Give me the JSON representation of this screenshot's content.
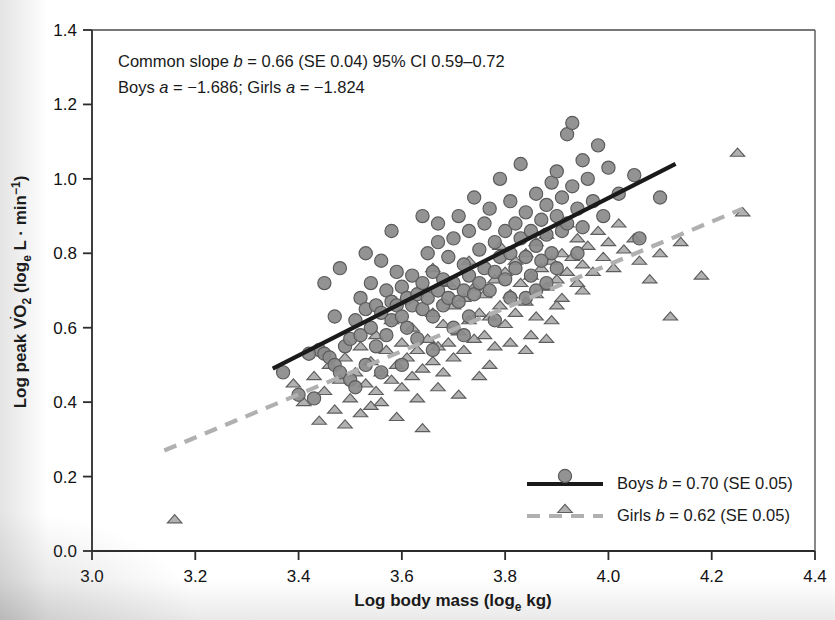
{
  "chart_data": {
    "type": "scatter",
    "title": "",
    "xlabel": "Log body mass (log_e kg)",
    "ylabel": "Log peak VO2 (log_e L · min^-1)",
    "xlim": [
      3.0,
      4.4
    ],
    "ylim": [
      0.0,
      1.4
    ],
    "xticks": [
      "3.0",
      "3.2",
      "3.4",
      "3.6",
      "3.8",
      "4.0",
      "4.2",
      "4.4"
    ],
    "yticks": [
      "0.0",
      "0.2",
      "0.4",
      "0.6",
      "0.8",
      "1.0",
      "1.2",
      "1.4"
    ],
    "grid": false,
    "legend_position": "bottom-right",
    "annotations": [
      "Common slope b = 0.66 (SE 0.04) 95% CI 0.59–0.72",
      "Boys a = −1.686; Girls a = −1.824"
    ],
    "series": [
      {
        "name": "Boys",
        "marker": "circle",
        "line_style": "solid",
        "color": "#8a8a8a",
        "line_color": "#1a1a1a",
        "slope": 0.7,
        "slope_se": 0.05,
        "intercept": -1.686,
        "fit_line": {
          "x1": 3.35,
          "y1": 0.49,
          "x2": 4.13,
          "y2": 1.04
        },
        "points": [
          [
            3.4,
            0.42
          ],
          [
            3.43,
            0.41
          ],
          [
            3.44,
            0.54
          ],
          [
            3.45,
            0.53
          ],
          [
            3.46,
            0.52
          ],
          [
            3.47,
            0.63
          ],
          [
            3.47,
            0.5
          ],
          [
            3.48,
            0.48
          ],
          [
            3.49,
            0.55
          ],
          [
            3.5,
            0.57
          ],
          [
            3.5,
            0.46
          ],
          [
            3.51,
            0.62
          ],
          [
            3.52,
            0.68
          ],
          [
            3.52,
            0.58
          ],
          [
            3.53,
            0.65
          ],
          [
            3.53,
            0.5
          ],
          [
            3.54,
            0.72
          ],
          [
            3.54,
            0.6
          ],
          [
            3.55,
            0.66
          ],
          [
            3.55,
            0.55
          ],
          [
            3.56,
            0.78
          ],
          [
            3.56,
            0.64
          ],
          [
            3.57,
            0.7
          ],
          [
            3.57,
            0.58
          ],
          [
            3.58,
            0.67
          ],
          [
            3.58,
            0.62
          ],
          [
            3.59,
            0.75
          ],
          [
            3.59,
            0.66
          ],
          [
            3.6,
            0.63
          ],
          [
            3.6,
            0.71
          ],
          [
            3.61,
            0.68
          ],
          [
            3.61,
            0.6
          ],
          [
            3.62,
            0.74
          ],
          [
            3.62,
            0.66
          ],
          [
            3.63,
            0.69
          ],
          [
            3.63,
            0.57
          ],
          [
            3.64,
            0.72
          ],
          [
            3.64,
            0.65
          ],
          [
            3.65,
            0.8
          ],
          [
            3.65,
            0.68
          ],
          [
            3.66,
            0.63
          ],
          [
            3.66,
            0.75
          ],
          [
            3.67,
            0.7
          ],
          [
            3.67,
            0.88
          ],
          [
            3.68,
            0.66
          ],
          [
            3.68,
            0.73
          ],
          [
            3.69,
            0.79
          ],
          [
            3.69,
            0.68
          ],
          [
            3.7,
            0.84
          ],
          [
            3.7,
            0.72
          ],
          [
            3.71,
            0.9
          ],
          [
            3.71,
            0.67
          ],
          [
            3.72,
            0.77
          ],
          [
            3.72,
            0.7
          ],
          [
            3.73,
            0.86
          ],
          [
            3.73,
            0.74
          ],
          [
            3.74,
            0.69
          ],
          [
            3.74,
            0.95
          ],
          [
            3.75,
            0.81
          ],
          [
            3.75,
            0.72
          ],
          [
            3.76,
            0.88
          ],
          [
            3.76,
            0.76
          ],
          [
            3.77,
            0.7
          ],
          [
            3.77,
            0.92
          ],
          [
            3.78,
            0.83
          ],
          [
            3.78,
            0.75
          ],
          [
            3.79,
            0.79
          ],
          [
            3.79,
            1.0
          ],
          [
            3.8,
            0.86
          ],
          [
            3.8,
            0.73
          ],
          [
            3.81,
            0.94
          ],
          [
            3.81,
            0.8
          ],
          [
            3.82,
            0.76
          ],
          [
            3.82,
            0.88
          ],
          [
            3.83,
            0.84
          ],
          [
            3.83,
            1.04
          ],
          [
            3.84,
            0.79
          ],
          [
            3.84,
            0.91
          ],
          [
            3.85,
            0.86
          ],
          [
            3.85,
            0.74
          ],
          [
            3.86,
            0.96
          ],
          [
            3.86,
            0.82
          ],
          [
            3.87,
            0.89
          ],
          [
            3.87,
            0.78
          ],
          [
            3.88,
            0.93
          ],
          [
            3.88,
            0.85
          ],
          [
            3.89,
            0.99
          ],
          [
            3.89,
            0.8
          ],
          [
            3.9,
            0.9
          ],
          [
            3.9,
            1.02
          ],
          [
            3.91,
            0.86
          ],
          [
            3.91,
            0.95
          ],
          [
            3.92,
            1.12
          ],
          [
            3.92,
            0.88
          ],
          [
            3.93,
            0.98
          ],
          [
            3.93,
            1.15
          ],
          [
            3.94,
            0.92
          ],
          [
            3.95,
            1.05
          ],
          [
            3.95,
            0.87
          ],
          [
            3.96,
            1.0
          ],
          [
            3.97,
            0.94
          ],
          [
            3.98,
            1.09
          ],
          [
            3.99,
            0.9
          ],
          [
            4.0,
            1.03
          ],
          [
            4.02,
            0.96
          ],
          [
            4.05,
            1.01
          ],
          [
            4.06,
            0.84
          ],
          [
            4.1,
            0.95
          ],
          [
            3.45,
            0.72
          ],
          [
            3.48,
            0.76
          ],
          [
            3.42,
            0.53
          ],
          [
            3.37,
            0.48
          ],
          [
            3.51,
            0.44
          ],
          [
            3.6,
            0.5
          ],
          [
            3.66,
            0.54
          ],
          [
            3.72,
            0.58
          ],
          [
            3.78,
            0.62
          ],
          [
            3.84,
            0.68
          ],
          [
            3.9,
            0.76
          ],
          [
            3.86,
            0.7
          ],
          [
            3.58,
            0.86
          ],
          [
            3.64,
            0.9
          ],
          [
            3.7,
            0.6
          ],
          [
            3.56,
            0.48
          ],
          [
            3.53,
            0.8
          ],
          [
            3.67,
            0.83
          ],
          [
            3.73,
            0.63
          ],
          [
            3.81,
            0.68
          ],
          [
            3.88,
            0.72
          ],
          [
            3.94,
            0.8
          ]
        ]
      },
      {
        "name": "Girls",
        "marker": "triangle",
        "line_style": "dashed",
        "color": "#9a9a9a",
        "line_color": "#b0b0b0",
        "slope": 0.62,
        "slope_se": 0.05,
        "intercept": -1.824,
        "fit_line": {
          "x1": 3.14,
          "y1": 0.27,
          "x2": 4.26,
          "y2": 0.92
        },
        "points": [
          [
            3.16,
            0.085
          ],
          [
            3.39,
            0.45
          ],
          [
            3.41,
            0.4
          ],
          [
            3.43,
            0.47
          ],
          [
            3.44,
            0.35
          ],
          [
            3.45,
            0.43
          ],
          [
            3.46,
            0.5
          ],
          [
            3.47,
            0.38
          ],
          [
            3.48,
            0.46
          ],
          [
            3.49,
            0.52
          ],
          [
            3.5,
            0.41
          ],
          [
            3.51,
            0.48
          ],
          [
            3.52,
            0.55
          ],
          [
            3.52,
            0.37
          ],
          [
            3.53,
            0.45
          ],
          [
            3.54,
            0.51
          ],
          [
            3.55,
            0.43
          ],
          [
            3.55,
            0.58
          ],
          [
            3.56,
            0.48
          ],
          [
            3.56,
            0.4
          ],
          [
            3.57,
            0.54
          ],
          [
            3.58,
            0.46
          ],
          [
            3.58,
            0.62
          ],
          [
            3.59,
            0.5
          ],
          [
            3.6,
            0.44
          ],
          [
            3.6,
            0.56
          ],
          [
            3.61,
            0.52
          ],
          [
            3.62,
            0.47
          ],
          [
            3.62,
            0.6
          ],
          [
            3.63,
            0.54
          ],
          [
            3.64,
            0.49
          ],
          [
            3.64,
            0.33
          ],
          [
            3.65,
            0.57
          ],
          [
            3.66,
            0.51
          ],
          [
            3.66,
            0.64
          ],
          [
            3.67,
            0.55
          ],
          [
            3.68,
            0.48
          ],
          [
            3.68,
            0.61
          ],
          [
            3.69,
            0.56
          ],
          [
            3.7,
            0.52
          ],
          [
            3.7,
            0.66
          ],
          [
            3.71,
            0.59
          ],
          [
            3.72,
            0.54
          ],
          [
            3.72,
            0.68
          ],
          [
            3.73,
            0.62
          ],
          [
            3.74,
            0.57
          ],
          [
            3.74,
            0.71
          ],
          [
            3.75,
            0.64
          ],
          [
            3.76,
            0.58
          ],
          [
            3.76,
            0.69
          ],
          [
            3.77,
            0.63
          ],
          [
            3.78,
            0.55
          ],
          [
            3.78,
            0.73
          ],
          [
            3.79,
            0.66
          ],
          [
            3.8,
            0.61
          ],
          [
            3.8,
            0.75
          ],
          [
            3.81,
            0.69
          ],
          [
            3.82,
            0.64
          ],
          [
            3.82,
            0.78
          ],
          [
            3.83,
            0.72
          ],
          [
            3.84,
            0.67
          ],
          [
            3.84,
            0.8
          ],
          [
            3.85,
            0.74
          ],
          [
            3.86,
            0.69
          ],
          [
            3.86,
            0.83
          ],
          [
            3.87,
            0.76
          ],
          [
            3.88,
            0.71
          ],
          [
            3.88,
            0.85
          ],
          [
            3.89,
            0.78
          ],
          [
            3.9,
            0.73
          ],
          [
            3.9,
            0.66
          ],
          [
            3.91,
            0.8
          ],
          [
            3.92,
            0.75
          ],
          [
            3.92,
            0.88
          ],
          [
            3.93,
            0.79
          ],
          [
            3.94,
            0.72
          ],
          [
            3.94,
            0.84
          ],
          [
            3.95,
            0.77
          ],
          [
            3.96,
            0.82
          ],
          [
            3.97,
            0.75
          ],
          [
            3.98,
            0.86
          ],
          [
            3.99,
            0.79
          ],
          [
            4.0,
            0.83
          ],
          [
            4.01,
            0.76
          ],
          [
            4.02,
            0.88
          ],
          [
            4.03,
            0.81
          ],
          [
            4.05,
            0.84
          ],
          [
            4.06,
            0.78
          ],
          [
            4.08,
            0.73
          ],
          [
            4.1,
            0.8
          ],
          [
            4.12,
            0.63
          ],
          [
            4.14,
            0.83
          ],
          [
            4.18,
            0.74
          ],
          [
            4.25,
            1.07
          ],
          [
            4.26,
            0.91
          ],
          [
            3.67,
            0.44
          ],
          [
            3.71,
            0.42
          ],
          [
            3.75,
            0.47
          ],
          [
            3.63,
            0.41
          ],
          [
            3.59,
            0.36
          ],
          [
            3.54,
            0.39
          ],
          [
            3.49,
            0.34
          ],
          [
            3.85,
            0.58
          ],
          [
            3.89,
            0.62
          ],
          [
            3.81,
            0.56
          ],
          [
            3.77,
            0.5
          ],
          [
            3.84,
            0.54
          ],
          [
            3.91,
            0.68
          ],
          [
            3.95,
            0.7
          ],
          [
            3.86,
            0.63
          ],
          [
            3.73,
            0.78
          ],
          [
            3.79,
            0.82
          ],
          [
            3.88,
            0.57
          ],
          [
            3.69,
            0.72
          ],
          [
            3.66,
            0.76
          ]
        ]
      }
    ]
  },
  "legend": {
    "items": [
      {
        "label": "Boys b = 0.70 (SE 0.05)",
        "series": "Boys"
      },
      {
        "label": "Girls b = 0.62 (SE 0.05)",
        "series": "Girls"
      }
    ]
  },
  "axes": {
    "x_label": "Log body mass (log",
    "x_label_sub": "e",
    "x_label_tail": " kg)",
    "y_label_head": "Log peak V",
    "y_label_vo": "O",
    "y_label_vo_sub": "2",
    "y_label_mid": " (log",
    "y_label_mid_sub": "e",
    "y_label_tail": " L · min",
    "y_label_sup": "−1",
    "y_label_close": ")"
  }
}
